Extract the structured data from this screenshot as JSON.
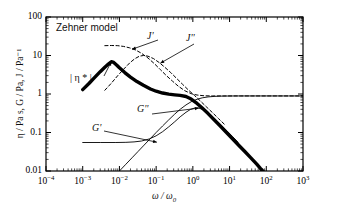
{
  "figure": {
    "model_label": "Zehner model",
    "background": "#ffffff",
    "frame_color": "#000000"
  },
  "axes": {
    "x": {
      "title_parts": {
        "omega": "ω",
        "slash": "/",
        "omega0": "ω",
        "sub": "0"
      },
      "title": "ω / ω₀",
      "ticks": [
        "10⁻⁴",
        "10⁻³",
        "10⁻²",
        "10⁻¹",
        "10⁰",
        "10¹",
        "10²",
        "10³"
      ],
      "tick_exponents": [
        "-4",
        "-3",
        "-2",
        "-1",
        "0",
        "1",
        "2",
        "3"
      ],
      "range": [
        -4,
        3
      ],
      "scale": "log",
      "minor_ticks": true
    },
    "y": {
      "title": "η / Pa s, G / Pa, J / Pa⁻¹",
      "ticks": [
        "0.01",
        "0.1",
        "1",
        "10",
        "100"
      ],
      "range": [
        -2,
        2
      ],
      "scale": "log",
      "minor_ticks": true
    }
  },
  "annotations": [
    {
      "id": "jp",
      "text": "J'",
      "style": "italic"
    },
    {
      "id": "jpp",
      "text": "J''",
      "style": "italic"
    },
    {
      "id": "eta",
      "text": "| η * |",
      "style": "upright"
    },
    {
      "id": "gp",
      "text": "G'",
      "style": "italic"
    },
    {
      "id": "gpp",
      "text": "G''",
      "style": "italic"
    }
  ],
  "chart_data": {
    "type": "line",
    "title": "Zehner model",
    "xlabel": "ω / ω₀",
    "ylabel": "η / Pa s, G / Pa, J / Pa⁻¹",
    "xscale": "log",
    "yscale": "log",
    "xlim": [
      0.0001,
      1000
    ],
    "ylim": [
      0.01,
      100
    ],
    "grid": false,
    "legend": "inline-annotations",
    "series": [
      {
        "name": "|η*|",
        "label": "| η * |",
        "style": "solid-thick",
        "color": "#000000",
        "width": 3.4,
        "points": [
          [
            0.001,
            1.3
          ],
          [
            0.0015,
            1.9
          ],
          [
            0.002,
            2.55
          ],
          [
            0.003,
            3.8
          ],
          [
            0.004,
            4.95
          ],
          [
            0.005,
            6.0
          ],
          [
            0.006,
            6.9
          ],
          [
            0.007,
            6.6
          ],
          [
            0.0085,
            5.6
          ],
          [
            0.01,
            4.8
          ],
          [
            0.014,
            3.6
          ],
          [
            0.02,
            2.75
          ],
          [
            0.03,
            2.1
          ],
          [
            0.045,
            1.68
          ],
          [
            0.07,
            1.35
          ],
          [
            0.1,
            1.18
          ],
          [
            0.15,
            1.06
          ],
          [
            0.22,
            0.99
          ],
          [
            0.32,
            0.95
          ],
          [
            0.45,
            0.92
          ],
          [
            0.65,
            0.86
          ],
          [
            0.9,
            0.74
          ],
          [
            1.3,
            0.57
          ],
          [
            1.8,
            0.43
          ],
          [
            2.6,
            0.31
          ],
          [
            3.8,
            0.215
          ],
          [
            5.5,
            0.15
          ],
          [
            8.0,
            0.103
          ],
          [
            12.0,
            0.069
          ],
          [
            18.0,
            0.046
          ],
          [
            26.0,
            0.032
          ],
          [
            38.0,
            0.022
          ],
          [
            55.0,
            0.015
          ],
          [
            70.0,
            0.0115
          ],
          [
            80.0,
            0.01
          ]
        ]
      },
      {
        "name": "J'",
        "label": "J'",
        "style": "dashed",
        "color": "#000000",
        "width": 1.0,
        "points": [
          [
            0.004,
            18.0
          ],
          [
            0.006,
            18.2
          ],
          [
            0.009,
            18.0
          ],
          [
            0.013,
            17.2
          ],
          [
            0.019,
            15.8
          ],
          [
            0.028,
            13.8
          ],
          [
            0.04,
            11.4
          ],
          [
            0.06,
            8.6
          ],
          [
            0.09,
            6.1
          ],
          [
            0.13,
            4.3
          ],
          [
            0.19,
            3.0
          ],
          [
            0.28,
            2.15
          ],
          [
            0.4,
            1.6
          ],
          [
            0.6,
            1.22
          ],
          [
            0.9,
            1.02
          ],
          [
            1.3,
            0.94
          ],
          [
            2.0,
            0.9
          ],
          [
            3.5,
            0.89
          ],
          [
            7.0,
            0.89
          ],
          [
            20.0,
            0.89
          ],
          [
            70.0,
            0.89
          ],
          [
            300.0,
            0.89
          ],
          [
            1000.0,
            0.89
          ]
        ]
      },
      {
        "name": "J''",
        "label": "J''",
        "style": "dashed",
        "color": "#000000",
        "width": 1.0,
        "points": [
          [
            0.004,
            1.25
          ],
          [
            0.006,
            1.9
          ],
          [
            0.009,
            3.0
          ],
          [
            0.013,
            4.4
          ],
          [
            0.019,
            6.4
          ],
          [
            0.026,
            8.2
          ],
          [
            0.035,
            9.6
          ],
          [
            0.045,
            10.0
          ],
          [
            0.06,
            9.6
          ],
          [
            0.085,
            8.3
          ],
          [
            0.12,
            6.6
          ],
          [
            0.17,
            5.0
          ],
          [
            0.25,
            3.6
          ],
          [
            0.36,
            2.55
          ],
          [
            0.52,
            1.8
          ],
          [
            0.75,
            1.28
          ],
          [
            1.1,
            0.92
          ],
          [
            1.6,
            0.66
          ],
          [
            2.3,
            0.47
          ],
          [
            3.4,
            0.33
          ],
          [
            5.0,
            0.23
          ],
          [
            7.5,
            0.158
          ]
        ]
      },
      {
        "name": "G'",
        "label": "G'",
        "style": "solid-thin",
        "color": "#000000",
        "width": 0.9,
        "points": [
          [
            0.01,
            0.01
          ],
          [
            0.015,
            0.015
          ],
          [
            0.022,
            0.022
          ],
          [
            0.032,
            0.032
          ],
          [
            0.047,
            0.047
          ],
          [
            0.07,
            0.07
          ],
          [
            0.1,
            0.1
          ],
          [
            0.15,
            0.148
          ],
          [
            0.22,
            0.213
          ],
          [
            0.32,
            0.3
          ],
          [
            0.45,
            0.4
          ],
          [
            0.65,
            0.52
          ],
          [
            0.9,
            0.63
          ],
          [
            1.3,
            0.73
          ],
          [
            1.8,
            0.795
          ],
          [
            2.6,
            0.84
          ],
          [
            3.8,
            0.865
          ],
          [
            5.5,
            0.88
          ],
          [
            8.0,
            0.885
          ],
          [
            15.0,
            0.89
          ],
          [
            40.0,
            0.89
          ],
          [
            120.0,
            0.89
          ],
          [
            400.0,
            0.89
          ],
          [
            1000.0,
            0.89
          ]
        ]
      },
      {
        "name": "G''",
        "label": "G''",
        "style": "solid-thin",
        "color": "#000000",
        "width": 0.9,
        "points": [
          [
            0.001,
            0.055
          ],
          [
            0.003,
            0.055
          ],
          [
            0.008,
            0.055
          ],
          [
            0.015,
            0.0555
          ],
          [
            0.025,
            0.057
          ],
          [
            0.04,
            0.06
          ],
          [
            0.065,
            0.068
          ],
          [
            0.1,
            0.082
          ],
          [
            0.15,
            0.105
          ],
          [
            0.22,
            0.14
          ],
          [
            0.32,
            0.19
          ],
          [
            0.45,
            0.255
          ],
          [
            0.65,
            0.335
          ],
          [
            0.85,
            0.395
          ],
          [
            1.1,
            0.43
          ],
          [
            1.4,
            0.435
          ],
          [
            1.8,
            0.4
          ],
          [
            2.4,
            0.335
          ],
          [
            3.2,
            0.27
          ],
          [
            4.4,
            0.205
          ],
          [
            6.0,
            0.153
          ],
          [
            8.5,
            0.11
          ],
          [
            12.0,
            0.079
          ],
          [
            17.0,
            0.056
          ]
        ]
      }
    ],
    "annotation_arrows": [
      {
        "label": "J'",
        "points_to": [
          0.022,
          14.5
        ]
      },
      {
        "label": "J''",
        "points_to": [
          0.13,
          6.3
        ]
      },
      {
        "label": "| η * |",
        "points_to": [
          0.006,
          6.9
        ]
      },
      {
        "label": "G'",
        "points_to": [
          0.105,
          0.056
        ]
      },
      {
        "label": "G''",
        "points_to": [
          1.45,
          0.43
        ]
      }
    ]
  }
}
